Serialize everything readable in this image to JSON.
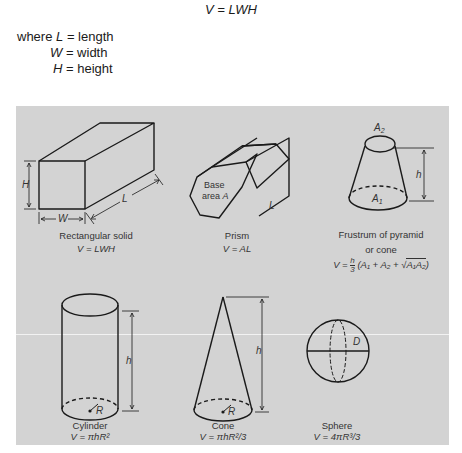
{
  "header": {
    "formula": "V = LWH",
    "where_rows": [
      {
        "prefix": "where ",
        "symbol": "L",
        "eq": " = ",
        "meaning": "length"
      },
      {
        "prefix": "",
        "symbol": "W",
        "eq": " = ",
        "meaning": "width"
      },
      {
        "prefix": "",
        "symbol": "H",
        "eq": " = ",
        "meaning": "height"
      }
    ]
  },
  "panel": {
    "background": "#d3d3d3",
    "shapes": [
      {
        "id": "rectangular-solid",
        "name": "Rectangular solid",
        "formula": "V = LWH",
        "labels": {
          "height": "H",
          "width": "W",
          "length": "L"
        }
      },
      {
        "id": "prism",
        "name": "Prism",
        "formula": "V = AL",
        "labels": {
          "base_line1": "Base",
          "base_line2": "area",
          "base_symbol": "A",
          "length": "L"
        }
      },
      {
        "id": "frustum",
        "name_line1": "Frustrum of pyramid",
        "name_line2": "or cone",
        "formula": "V = h/3 (A1 + A2 + √(A1A2))",
        "formula_parts": {
          "lhs": "V = ",
          "num": "h",
          "den": "3",
          "body": "(A₁ + A₂ + ",
          "root": "A₁A₂",
          "close": ")"
        },
        "labels": {
          "top": "A₂",
          "bottom": "A₁",
          "height": "h"
        }
      },
      {
        "id": "cylinder",
        "name": "Cylinder",
        "formula": "V = πhR²",
        "labels": {
          "height": "h",
          "radius": "R"
        }
      },
      {
        "id": "cone",
        "name": "Cone",
        "formula": "V = πhR²/3",
        "labels": {
          "height": "h",
          "radius": "R"
        }
      },
      {
        "id": "sphere",
        "name": "Sphere",
        "formula": "V = 4πR³/3",
        "labels": {
          "diameter": "D"
        }
      }
    ]
  }
}
